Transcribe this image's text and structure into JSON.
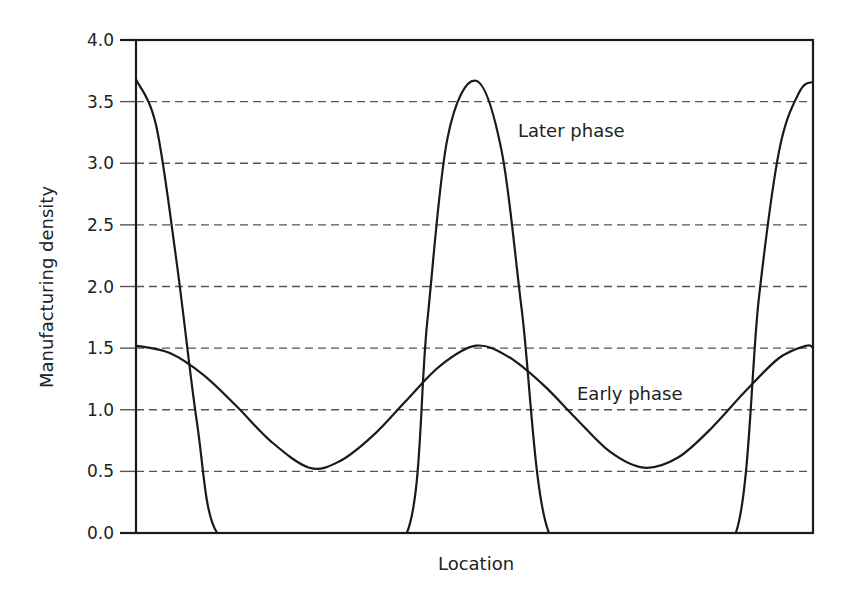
{
  "chart_data": {
    "type": "line",
    "title": "",
    "xlabel": "Location",
    "ylabel": "Manufacturing density",
    "ylim": [
      0.0,
      4.0
    ],
    "yticks": [
      "0.0",
      "0.5",
      "1.0",
      "1.5",
      "2.0",
      "2.5",
      "3.0",
      "3.5",
      "4.0"
    ],
    "xticks": [],
    "grid": "horizontal dashed at each y tick",
    "legend": "none (inline annotations)",
    "x_domain": [
      0,
      1
    ],
    "series": [
      {
        "name": "Early phase",
        "description": "Smooth sinusoid, peaks ~1.52 at x=0, ~0.50, ~1.0; minima ~0.53 at ~0.26 and ~0.75",
        "x": [
          0.0,
          0.05,
          0.1,
          0.15,
          0.2,
          0.256,
          0.3,
          0.35,
          0.4,
          0.45,
          0.502,
          0.55,
          0.6,
          0.65,
          0.7,
          0.75,
          0.8,
          0.85,
          0.9,
          0.95,
          0.99,
          1.0
        ],
        "values": [
          1.52,
          1.46,
          1.28,
          1.02,
          0.74,
          0.53,
          0.58,
          0.79,
          1.08,
          1.36,
          1.52,
          1.43,
          1.21,
          0.93,
          0.66,
          0.53,
          0.61,
          0.85,
          1.15,
          1.42,
          1.52,
          1.5
        ]
      },
      {
        "name": "Later phase",
        "description": "Sharp peaks ~3.68 at x=0, ~0.50, 1.0; zero between ~0.12-0.40 and ~0.61-0.89",
        "x": [
          0.0,
          0.03,
          0.06,
          0.09,
          0.12,
          0.2,
          0.3,
          0.4,
          0.43,
          0.46,
          0.502,
          0.54,
          0.57,
          0.61,
          0.7,
          0.8,
          0.886,
          0.92,
          0.95,
          0.98,
          1.0
        ],
        "values": [
          3.68,
          3.3,
          2.2,
          0.9,
          0.0,
          0.0,
          0.0,
          0.0,
          1.7,
          3.2,
          3.67,
          3.1,
          1.8,
          0.0,
          0.0,
          0.0,
          0.0,
          1.9,
          3.1,
          3.58,
          3.66
        ]
      }
    ],
    "annotations": [
      {
        "text": "Later phase",
        "x": 0.56,
        "y": 3.27
      },
      {
        "text": "Early phase",
        "x": 0.65,
        "y": 1.15
      }
    ]
  },
  "colors": {
    "line": "#1a1a1a",
    "grid": "#555555",
    "text": "#222222",
    "background": "#ffffff"
  }
}
